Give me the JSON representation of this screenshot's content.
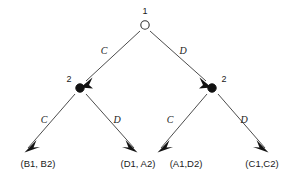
{
  "diagram": {
    "type": "game-tree",
    "nodes": [
      {
        "id": "root",
        "label": "1",
        "style": "open",
        "x": 145,
        "y": 25
      },
      {
        "id": "left",
        "label": "2",
        "style": "filled",
        "x": 80,
        "y": 88
      },
      {
        "id": "right",
        "label": "2",
        "style": "filled",
        "x": 212,
        "y": 88
      }
    ],
    "edges": [
      {
        "id": "root-left",
        "label": "C",
        "from": "root",
        "to": "left",
        "label_x": 104,
        "label_y": 54
      },
      {
        "id": "root-right",
        "label": "D",
        "from": "root",
        "to": "right",
        "label_x": 183,
        "label_y": 54
      },
      {
        "id": "left-outcome-1",
        "label": "C",
        "from": "left",
        "to": "B1B2",
        "label_x": 44,
        "label_y": 123
      },
      {
        "id": "left-outcome-2",
        "label": "D",
        "from": "left",
        "to": "D1A2",
        "label_x": 117,
        "label_y": 123
      },
      {
        "id": "right-outcome-1",
        "label": "C",
        "from": "right",
        "to": "A1D2",
        "label_x": 170,
        "label_y": 123
      },
      {
        "id": "right-outcome-2",
        "label": "D",
        "from": "right",
        "to": "C1C2",
        "label_x": 244,
        "label_y": 123
      }
    ],
    "outcomes": [
      {
        "id": "B1B2",
        "label": "(B1, B2)",
        "x": 38,
        "y": 167
      },
      {
        "id": "D1A2",
        "label": "(D1, A2)",
        "x": 138,
        "y": 167
      },
      {
        "id": "A1D2",
        "label": "(A1,D2)",
        "x": 186,
        "y": 167
      },
      {
        "id": "C1C2",
        "label": "(C1,C2)",
        "x": 262,
        "y": 167
      }
    ],
    "colors": {
      "edge": "#4d4d4d",
      "arrow": "#121212",
      "open_node_fill": "#ffffff",
      "filled_node_fill": "#111111",
      "text": "#1a1a1a",
      "background": "#ffffff"
    }
  }
}
